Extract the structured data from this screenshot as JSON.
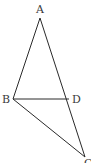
{
  "diagram": {
    "type": "geometry-triangle",
    "stroke_color": "#2a2a2a",
    "label_color": "#3a3a3a",
    "points": {
      "A": {
        "label": "A",
        "x": 40,
        "y": 18,
        "lx": 36,
        "ly": 13
      },
      "B": {
        "label": "B",
        "x": 13,
        "y": 99,
        "lx": 2,
        "ly": 103
      },
      "D": {
        "label": "D",
        "x": 69,
        "y": 99,
        "lx": 72,
        "ly": 103
      },
      "C": {
        "label": "C",
        "x": 85,
        "y": 157,
        "lx": 84,
        "ly": 167
      }
    },
    "segments": [
      {
        "from": "A",
        "to": "B"
      },
      {
        "from": "A",
        "to": "C"
      },
      {
        "from": "B",
        "to": "D"
      },
      {
        "from": "B",
        "to": "C"
      }
    ]
  }
}
